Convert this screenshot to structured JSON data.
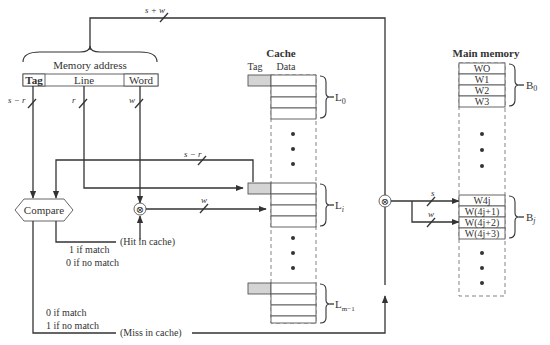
{
  "diagram": {
    "type": "direct-mapped cache organization",
    "top_bus_label": "s + w",
    "memory_address": {
      "title": "Memory address",
      "fields": [
        {
          "label": "Tag",
          "width_label": "s − r"
        },
        {
          "label": "Line",
          "width_label": "r"
        },
        {
          "label": "Word",
          "width_label": "w"
        }
      ]
    },
    "cache": {
      "title": "Cache",
      "col_tag": "Tag",
      "col_data": "Data",
      "lines": [
        {
          "label": "L",
          "sub": "0"
        },
        {
          "label": "L",
          "sub": "i"
        },
        {
          "label": "L",
          "sub": "m−1"
        }
      ]
    },
    "compare": {
      "label": "Compare",
      "tag_bus_label": "s − r",
      "hit_label": "(Hit in cache)",
      "hit_cond_1": "1 if match",
      "hit_cond_2": "0 if no match",
      "miss_cond_1": "0 if match",
      "miss_cond_2": "1 if no match",
      "miss_label": "(Miss in cache)"
    },
    "mux_word_label": "w",
    "main_memory": {
      "title": "Main memory",
      "block0": {
        "words": [
          "WO",
          "W1",
          "W2",
          "W3"
        ],
        "label": "B",
        "sub": "0"
      },
      "blockj": {
        "words": [
          "W4j",
          "W(4j+1)",
          "W(4j+2)",
          "W(4j+3)"
        ],
        "label": "B",
        "sub": "j"
      },
      "bus_s_label": "s",
      "bus_w_label": "w"
    },
    "symbols": {
      "mux": "⊗"
    }
  }
}
